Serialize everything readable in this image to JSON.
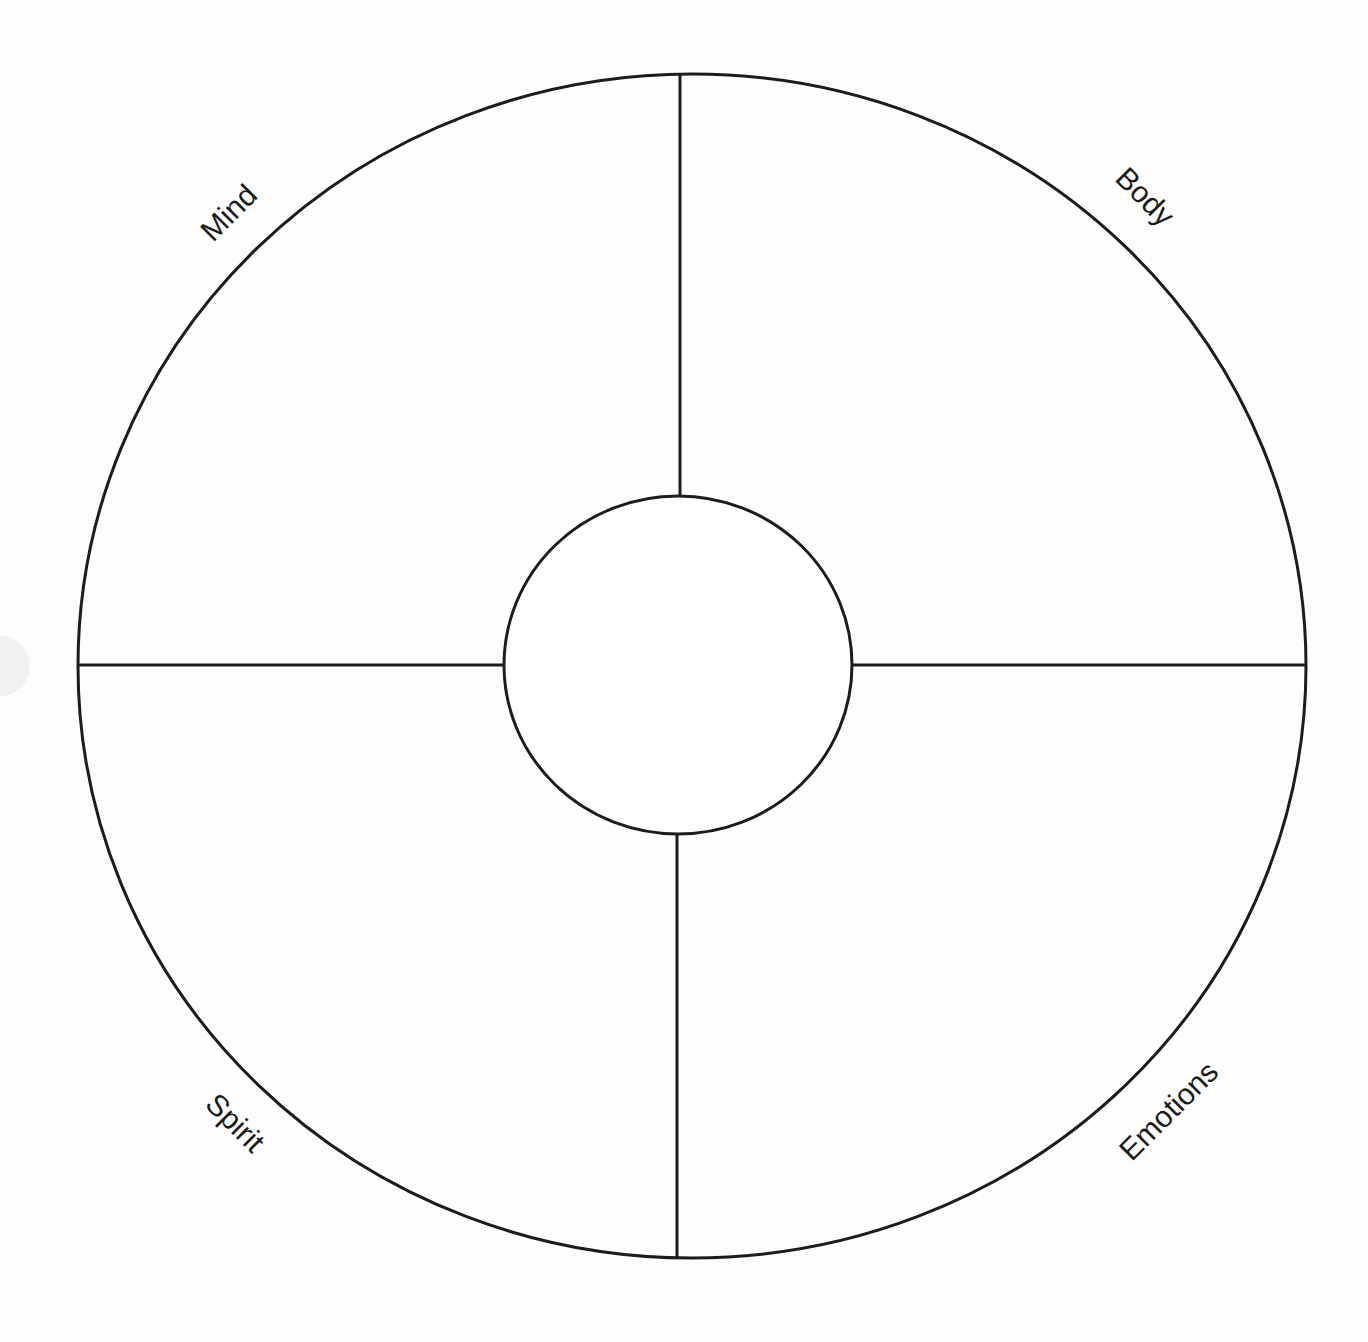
{
  "diagram": {
    "type": "wellness-wheel",
    "stroke_color": "#1c1c1c",
    "background": "#fdfdfd",
    "quadrants": [
      {
        "id": "mind",
        "label": "Mind",
        "position": "top-left"
      },
      {
        "id": "body",
        "label": "Body",
        "position": "top-right"
      },
      {
        "id": "spirit",
        "label": "Spirit",
        "position": "bottom-left"
      },
      {
        "id": "emotions",
        "label": "Emotions",
        "position": "bottom-right"
      }
    ],
    "center_circle_label": ""
  }
}
